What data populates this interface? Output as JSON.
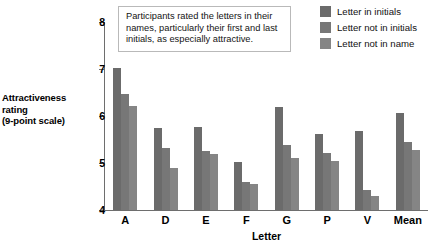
{
  "chart_data": {
    "type": "bar",
    "title": "",
    "xlabel": "Letter",
    "ylabel": "Attractiveness rating (9-point scale)",
    "ylabel_lines": [
      "Attractiveness",
      "rating",
      "(9-point scale)"
    ],
    "ylim": [
      4,
      8
    ],
    "yticks": [
      4,
      5,
      6,
      7,
      8
    ],
    "ytick_labels": [
      "4",
      "5",
      "6",
      "7",
      "8"
    ],
    "grid": false,
    "legend_position": "top-right",
    "categories": [
      "A",
      "D",
      "E",
      "F",
      "G",
      "P",
      "V",
      "Mean"
    ],
    "series": [
      {
        "name": "Letter in initials",
        "color": "#6b6b6b",
        "values": [
          7.03,
          5.74,
          5.76,
          5.02,
          6.2,
          5.61,
          5.69,
          6.07
        ]
      },
      {
        "name": "Letter not in initials",
        "color": "#777777",
        "values": [
          6.47,
          5.33,
          5.25,
          4.6,
          5.39,
          5.21,
          4.43,
          5.45
        ]
      },
      {
        "name": "Letter not in name",
        "color": "#858585",
        "values": [
          6.22,
          4.89,
          5.19,
          4.56,
          5.11,
          5.05,
          4.29,
          5.28
        ]
      }
    ],
    "annotation": "Participants rated the letters in their names, particularly their first and last initials, as especially attractive."
  },
  "legend": {
    "items": [
      {
        "label": "Letter in initials"
      },
      {
        "label": "Letter not in initials"
      },
      {
        "label": "Letter not in name"
      }
    ]
  }
}
